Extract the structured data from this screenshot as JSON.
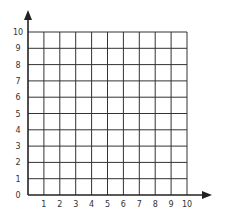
{
  "diagram": {
    "type": "coordinate-grid",
    "x_axis": {
      "labels": [
        "1",
        "2",
        "3",
        "4",
        "5",
        "6",
        "7",
        "8",
        "9",
        "10"
      ],
      "origin_label": "0",
      "min": 0,
      "max": 10,
      "arrow": true
    },
    "y_axis": {
      "labels": [
        "1",
        "2",
        "3",
        "4",
        "5",
        "6",
        "7",
        "8",
        "9",
        "10"
      ],
      "min": 0,
      "max": 10,
      "arrow": true
    },
    "grid": {
      "rows": 10,
      "cols": 10
    },
    "colors": {
      "line": "#333333",
      "background": "#ffffff"
    }
  }
}
